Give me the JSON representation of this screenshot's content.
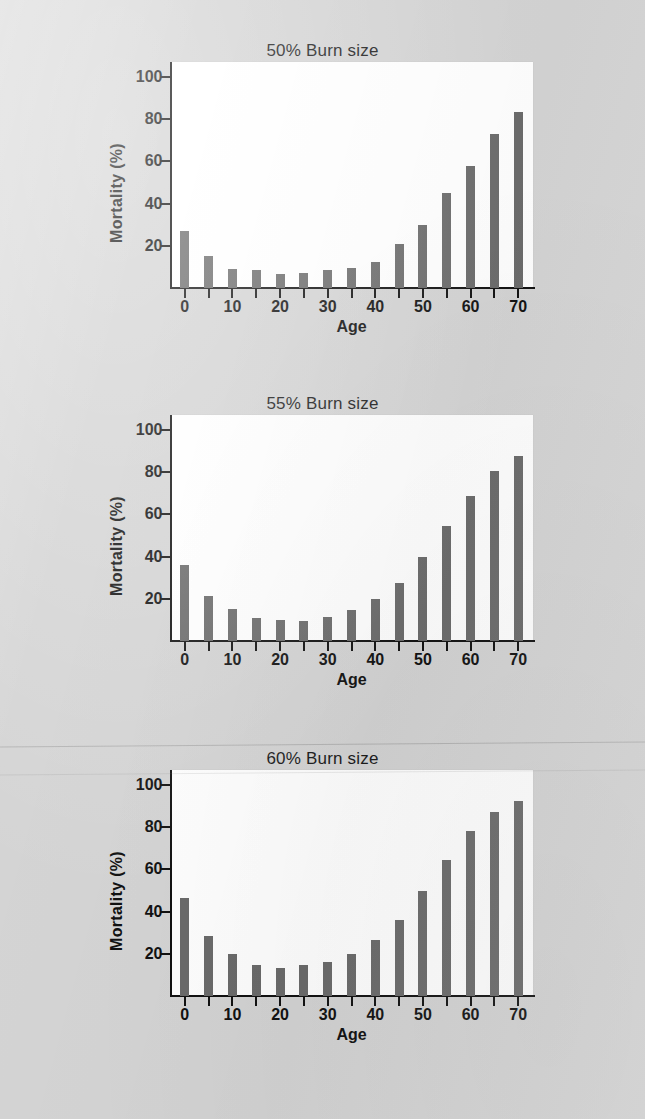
{
  "figure": {
    "background_color": "#d4d4d4",
    "bar_color": "#6b6b6b",
    "plot_background_color": "#ffffff",
    "axis_color": "#111111"
  },
  "chart_data": [
    {
      "type": "bar",
      "title": "50% Burn size",
      "xlabel": "Age",
      "ylabel": "Mortality (%)",
      "categories": [
        0,
        5,
        10,
        15,
        20,
        25,
        30,
        35,
        40,
        45,
        50,
        55,
        60,
        65,
        70
      ],
      "values": [
        27,
        15,
        9,
        8.5,
        6.5,
        7,
        8.5,
        9.5,
        12.5,
        21,
        30,
        45,
        58,
        73,
        83.5
      ],
      "xlim": [
        -3,
        73
      ],
      "ylim": [
        0,
        107
      ],
      "xticks": [
        0,
        10,
        20,
        30,
        40,
        50,
        60,
        70
      ],
      "xticks_minor": [
        5,
        15,
        25,
        35,
        45,
        55,
        65
      ],
      "yticks": [
        20,
        40,
        60,
        80,
        100
      ],
      "grid": false,
      "legend": null
    },
    {
      "type": "bar",
      "title": "55% Burn size",
      "xlabel": "Age",
      "ylabel": "Mortality (%)",
      "categories": [
        0,
        5,
        10,
        15,
        20,
        25,
        30,
        35,
        40,
        45,
        50,
        55,
        60,
        65,
        70
      ],
      "values": [
        36,
        21.5,
        15,
        11,
        10,
        9.5,
        11.5,
        14.5,
        20,
        27.5,
        40,
        54.5,
        68.5,
        80.5,
        87.5
      ],
      "xlim": [
        -3,
        73
      ],
      "ylim": [
        0,
        107
      ],
      "xticks": [
        0,
        10,
        20,
        30,
        40,
        50,
        60,
        70
      ],
      "xticks_minor": [
        5,
        15,
        25,
        35,
        45,
        55,
        65
      ],
      "yticks": [
        20,
        40,
        60,
        80,
        100
      ],
      "grid": false,
      "legend": null
    },
    {
      "type": "bar",
      "title": "60% Burn size",
      "xlabel": "Age",
      "ylabel": "Mortality (%)",
      "categories": [
        0,
        5,
        10,
        15,
        20,
        25,
        30,
        35,
        40,
        45,
        50,
        55,
        60,
        65,
        70
      ],
      "values": [
        46.5,
        28.5,
        20,
        14.5,
        13.5,
        14.5,
        16,
        20,
        26.5,
        36,
        49.5,
        64.5,
        78,
        87,
        92.5
      ],
      "xlim": [
        -3,
        73
      ],
      "ylim": [
        0,
        107
      ],
      "xticks": [
        0,
        10,
        20,
        30,
        40,
        50,
        60,
        70
      ],
      "xticks_minor": [
        5,
        15,
        25,
        35,
        45,
        55,
        65
      ],
      "yticks": [
        20,
        40,
        60,
        80,
        100
      ],
      "grid": false,
      "legend": null
    }
  ],
  "panels": [
    {
      "top": 40
    },
    {
      "top": 393
    },
    {
      "top": 748
    }
  ]
}
